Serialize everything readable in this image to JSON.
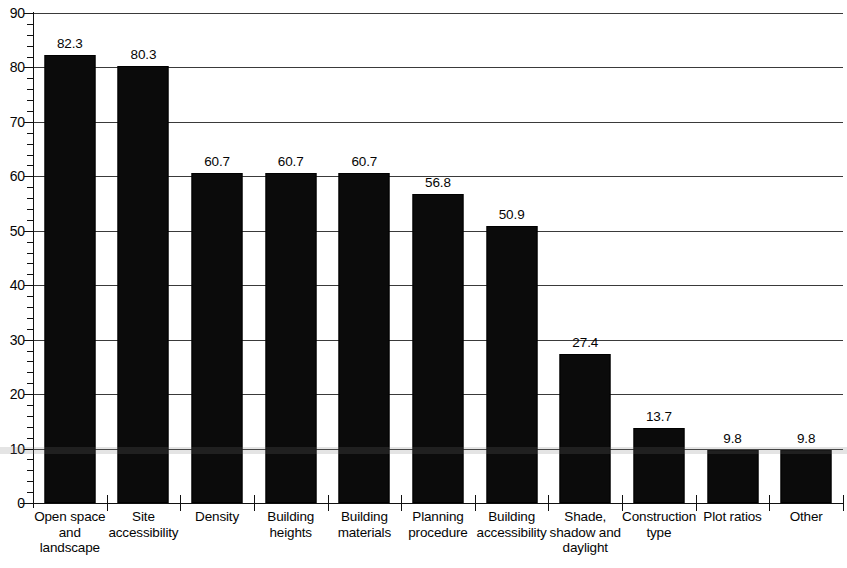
{
  "chart_data": {
    "type": "bar",
    "title": "",
    "subtitle": "",
    "xlabel": "",
    "ylabel": "",
    "ylim": [
      0,
      90
    ],
    "ytick_step": 10,
    "yminor_step": 2,
    "grid": "horizontal",
    "legend": "none",
    "orientation": "vertical",
    "bar_color": "#0b0b0b",
    "background_color": "#ffffff",
    "gridline_color": "#3a3a3a",
    "value_labels": true,
    "categories": [
      "Open space and landscape",
      "Site accessibility",
      "Density",
      "Building heights",
      "Building materials",
      "Planning procedure",
      "Building accessibility",
      "Shade, shadow and daylight",
      "Construction type",
      "Plot ratios",
      "Other"
    ],
    "category_lines": [
      [
        "Open space",
        "and",
        "landscape"
      ],
      [
        "Site",
        "accessibility"
      ],
      [
        "Density"
      ],
      [
        "Building",
        "heights"
      ],
      [
        "Building",
        "materials"
      ],
      [
        "Planning",
        "procedure"
      ],
      [
        "Building",
        "accessibility"
      ],
      [
        "Shade,",
        "shadow and",
        "daylight"
      ],
      [
        "Construction",
        "type"
      ],
      [
        "Plot ratios"
      ],
      [
        "Other"
      ]
    ],
    "values": [
      82.3,
      80.3,
      60.7,
      60.7,
      60.7,
      56.8,
      50.9,
      27.4,
      13.7,
      9.8,
      9.8
    ],
    "value_label_text": [
      "82.3",
      "80.3",
      "60.7",
      "60.7",
      "60.7",
      "56.8",
      "50.9",
      "27.4",
      "13.7",
      "9.8",
      "9.8"
    ],
    "ytick_labels": [
      "0",
      "10",
      "20",
      "30",
      "40",
      "50",
      "60",
      "70",
      "80",
      "90"
    ],
    "ytick_values": [
      0,
      10,
      20,
      30,
      40,
      50,
      60,
      70,
      80,
      90
    ]
  }
}
